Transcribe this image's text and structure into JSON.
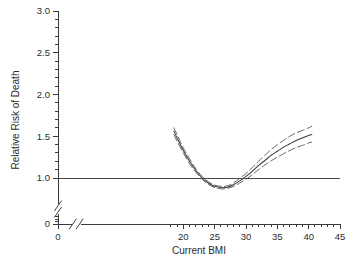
{
  "chart_data": {
    "type": "line",
    "title": "",
    "xlabel": "Current BMI",
    "ylabel": "Relative Risk of Death",
    "xlim": [
      0,
      45
    ],
    "ylim": [
      0,
      3.0
    ],
    "grid": false,
    "legend": "none",
    "axis_break_x": true,
    "axis_break_y": true,
    "x_tick_labels": [
      "0",
      "20",
      "25",
      "30",
      "35",
      "40",
      "45"
    ],
    "x_tick_values": [
      0,
      20,
      25,
      30,
      35,
      40,
      45
    ],
    "x_minor_tick_step": 1,
    "y_tick_labels": [
      "0",
      "1.0",
      "1.5",
      "2.0",
      "2.5",
      "3.0"
    ],
    "y_tick_values": [
      0,
      1.0,
      1.5,
      2.0,
      2.5,
      3.0
    ],
    "y_minor_tick_step": 0.1,
    "reference_line": {
      "y": 1.0,
      "style": "solid",
      "label": ""
    },
    "x": [
      18.5,
      19,
      20,
      21,
      22,
      23,
      24,
      25,
      26,
      27,
      28,
      29,
      30,
      31,
      32,
      33,
      34,
      35,
      36,
      37,
      38,
      39,
      40,
      40.5
    ],
    "series": [
      {
        "name": "Relative risk (point estimate)",
        "style": "solid",
        "values": [
          1.56,
          1.48,
          1.33,
          1.2,
          1.09,
          1.0,
          0.94,
          0.9,
          0.885,
          0.89,
          0.92,
          0.965,
          1.02,
          1.08,
          1.15,
          1.21,
          1.27,
          1.32,
          1.37,
          1.41,
          1.45,
          1.48,
          1.51,
          1.52
        ]
      },
      {
        "name": "Upper 95% confidence limit",
        "style": "dashed",
        "values": [
          1.6,
          1.52,
          1.36,
          1.23,
          1.11,
          1.02,
          0.955,
          0.915,
          0.9,
          0.905,
          0.94,
          0.995,
          1.055,
          1.125,
          1.2,
          1.27,
          1.34,
          1.4,
          1.45,
          1.5,
          1.54,
          1.57,
          1.6,
          1.62
        ]
      },
      {
        "name": "Lower 95% confidence limit",
        "style": "dashed",
        "values": [
          1.52,
          1.44,
          1.3,
          1.17,
          1.07,
          0.985,
          0.925,
          0.885,
          0.87,
          0.875,
          0.9,
          0.94,
          0.985,
          1.04,
          1.1,
          1.155,
          1.205,
          1.25,
          1.29,
          1.33,
          1.365,
          1.39,
          1.42,
          1.43
        ]
      }
    ]
  }
}
